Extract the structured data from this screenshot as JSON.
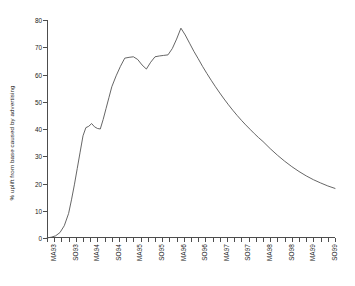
{
  "chart_data": {
    "type": "line",
    "title": "",
    "xlabel": "",
    "ylabel": "% uplift from base caused by advertising",
    "ylim": [
      0,
      80
    ],
    "ytick_labels": [
      "0",
      "10",
      "20",
      "30",
      "40",
      "50",
      "60",
      "70",
      "80"
    ],
    "ytick_values": [
      0,
      10,
      20,
      30,
      40,
      50,
      60,
      70,
      80
    ],
    "grid": false,
    "legend": "none",
    "categories": [
      "MA93",
      "SO93",
      "MA94",
      "SO94",
      "MA95",
      "SO95",
      "MA96",
      "SO96",
      "MA97",
      "SO97",
      "MA98",
      "SO98",
      "MA99",
      "SO99"
    ],
    "x_minor_tick_count": 40,
    "x_label_every": 3,
    "series": [
      {
        "name": "% uplift from base caused by advertising",
        "color": "#555555",
        "x": [
          0.0,
          0.6,
          1.2,
          1.8,
          2.4,
          3.0,
          3.4,
          3.8,
          4.2,
          4.6,
          5.0,
          5.4,
          5.8,
          6.2,
          6.6,
          7.0,
          7.4,
          7.8,
          8.2,
          8.6,
          9.0,
          9.6,
          10.2,
          10.8,
          11.4,
          12.0,
          12.6,
          13.2,
          13.8,
          14.4,
          15.0,
          15.6,
          16.2,
          16.8,
          17.4,
          18.0,
          18.6,
          19.2,
          19.8,
          20.4,
          21.0,
          21.6,
          22.2,
          22.8,
          23.4,
          24.0,
          24.6,
          25.2,
          25.8,
          26.4,
          27.0,
          27.6,
          28.2,
          28.8,
          29.4,
          30.0,
          31.0,
          32.0,
          33.0,
          34.0,
          35.0,
          36.0,
          37.0,
          38.0,
          39.0,
          40.0
        ],
        "y": [
          0.0,
          0.3,
          0.8,
          2.0,
          4.5,
          9.0,
          14.0,
          19.5,
          25.5,
          31.5,
          37.5,
          40.5,
          41.0,
          42.0,
          40.8,
          40.2,
          40.0,
          43.5,
          47.5,
          51.5,
          55.5,
          59.5,
          63.0,
          66.0,
          66.3,
          66.5,
          65.5,
          63.5,
          62.0,
          64.5,
          66.5,
          66.8,
          67.0,
          67.2,
          69.5,
          73.0,
          77.0,
          74.5,
          71.5,
          68.5,
          65.8,
          63.0,
          60.4,
          57.9,
          55.5,
          53.2,
          51.0,
          48.9,
          46.9,
          45.0,
          43.2,
          41.5,
          39.9,
          38.3,
          36.8,
          35.4,
          32.8,
          30.4,
          28.2,
          26.2,
          24.4,
          22.8,
          21.4,
          20.2,
          19.1,
          18.2
        ]
      }
    ]
  }
}
